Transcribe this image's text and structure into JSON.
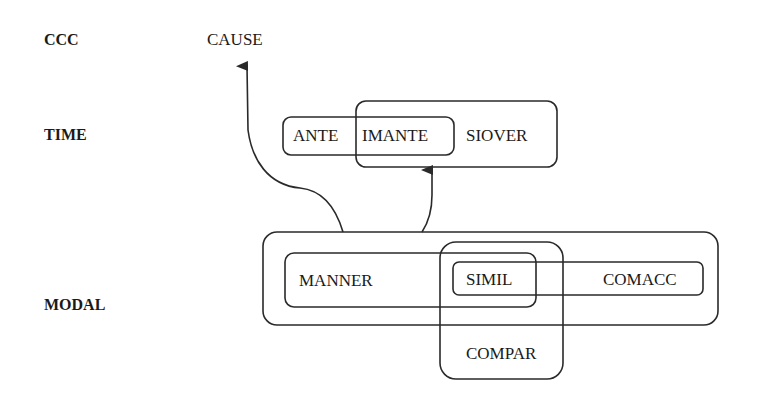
{
  "rows": {
    "ccc": "CCC",
    "time": "TIME",
    "modal": "MODAL"
  },
  "nodes": {
    "cause": "CAUSE",
    "ante": "ANTE",
    "imante": "IMANTE",
    "siover": "SIOVER",
    "manner": "MANNER",
    "simil": "SIMIL",
    "comacc": "COMACC",
    "compar": "COMPAR"
  },
  "edges": [
    {
      "from": "modal-group",
      "to": "cause"
    },
    {
      "from": "modal-group",
      "to": "imante-siover-group"
    }
  ],
  "colors": {
    "stroke": "#2a2a2a",
    "text": "#1a1a1a",
    "background": "#ffffff"
  }
}
